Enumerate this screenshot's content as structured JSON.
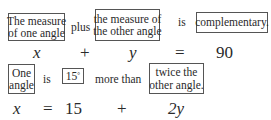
{
  "statement1": {
    "box1": {
      "line1": "The measure",
      "line2": "of one angle"
    },
    "word1": "plus",
    "box2": {
      "line1": "the measure of",
      "line2": "the other angle"
    },
    "word2": "is",
    "box3": "complementary.",
    "equation": {
      "t1": "x",
      "op1": "+",
      "t2": "y",
      "op2": "=",
      "t3": "90"
    }
  },
  "statement2": {
    "box1": {
      "line1": "One",
      "line2": "angle"
    },
    "word1": "is",
    "box2": {
      "value": "15",
      "unit": "°"
    },
    "word2": "more than",
    "box3": {
      "line1": "twice the",
      "line2": "other angle."
    },
    "equation": {
      "t1": "x",
      "op1": "=",
      "t2": "15",
      "op2": "+",
      "t3": "2y"
    }
  }
}
